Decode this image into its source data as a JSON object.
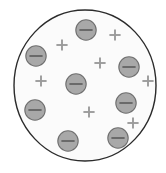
{
  "figure": {
    "title": "Charged sphere cross-section",
    "description": "A large circle containing scattered negative charge particles and plus signs",
    "background_color": "#ffffff"
  },
  "sphere": {
    "name": "sphere-outline",
    "cx": 85,
    "cy": 85.5,
    "rx": 71,
    "ry": 75.5,
    "stroke_color": "#2b2b2b",
    "stroke_width": 1.4,
    "fill_color": "#fbfbfb"
  },
  "style": {
    "negative_fill": "#a8a8a8",
    "negative_stroke": "#6f6f6f",
    "negative_stroke_width": 1.1,
    "negative_radius": 10.2,
    "negative_dash_color": "#5a5a5a",
    "negative_dash_width": 1.6,
    "negative_dash_half_length": 6.6,
    "plus_color": "#9b9b9b",
    "plus_stroke_width": 1.9,
    "plus_half_length": 5.6
  },
  "negative_charges": [
    {
      "label": "negative-charge-top",
      "symbol": "−",
      "cx": 86,
      "cy": 30
    },
    {
      "label": "negative-charge-upper-left",
      "symbol": "−",
      "cx": 36,
      "cy": 56
    },
    {
      "label": "negative-charge-upper-right",
      "symbol": "−",
      "cx": 129,
      "cy": 67
    },
    {
      "label": "negative-charge-center",
      "symbol": "−",
      "cx": 76,
      "cy": 84
    },
    {
      "label": "negative-charge-right",
      "symbol": "−",
      "cx": 126,
      "cy": 103
    },
    {
      "label": "negative-charge-left",
      "symbol": "−",
      "cx": 35,
      "cy": 110
    },
    {
      "label": "negative-charge-lower-right",
      "symbol": "−",
      "cx": 118,
      "cy": 138
    },
    {
      "label": "negative-charge-bottom",
      "symbol": "−",
      "cx": 68,
      "cy": 141
    }
  ],
  "positive_charges": [
    {
      "label": "positive-charge-upper-left",
      "symbol": "+",
      "cx": 62,
      "cy": 45
    },
    {
      "label": "positive-charge-top-right",
      "symbol": "+",
      "cx": 115,
      "cy": 35
    },
    {
      "label": "positive-charge-upper-mid",
      "symbol": "+",
      "cx": 100,
      "cy": 63
    },
    {
      "label": "positive-charge-mid-left",
      "symbol": "+",
      "cx": 41,
      "cy": 81
    },
    {
      "label": "positive-charge-mid-right",
      "symbol": "+",
      "cx": 148,
      "cy": 81
    },
    {
      "label": "positive-charge-lower-mid",
      "symbol": "+",
      "cx": 89,
      "cy": 112
    },
    {
      "label": "positive-charge-lower-right",
      "symbol": "+",
      "cx": 133,
      "cy": 123
    }
  ],
  "counts": {
    "negative_total": "8",
    "positive_total": "7"
  }
}
